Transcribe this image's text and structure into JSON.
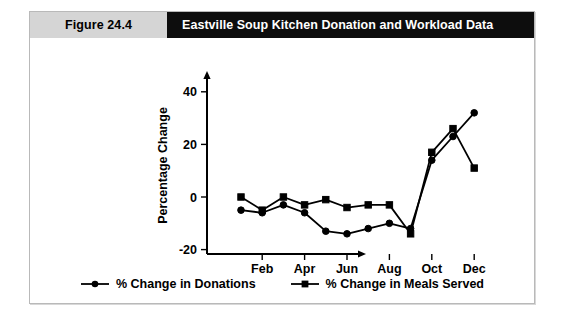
{
  "figure": {
    "number_label": "Figure 24.4",
    "title": "Eastville Soup Kitchen Donation and Workload Data"
  },
  "legend": {
    "items": [
      {
        "label": "% Change in Donations",
        "marker": "circle-marker-icon",
        "color": "#000000"
      },
      {
        "label": "% Change in Meals Served",
        "marker": "square-marker-icon",
        "color": "#000000"
      }
    ]
  },
  "chart_data": {
    "type": "line",
    "title": "Eastville Soup Kitchen Donation and Workload Data",
    "xlabel": "",
    "ylabel": "Percentage Change",
    "x": [
      "Jan",
      "Feb",
      "Mar",
      "Apr",
      "May",
      "Jun",
      "Jul",
      "Aug",
      "Sep",
      "Oct",
      "Nov",
      "Dec"
    ],
    "xtick_labels": [
      "Feb",
      "Apr",
      "Jun",
      "Aug",
      "Oct",
      "Dec"
    ],
    "xtick_indices": [
      1,
      3,
      5,
      7,
      9,
      11
    ],
    "ytick_labels": [
      "40",
      "20",
      "0",
      "-20"
    ],
    "yticks": [
      40,
      20,
      0,
      -20
    ],
    "ylim": [
      -20,
      45
    ],
    "grid": false,
    "legend_position": "bottom",
    "series": [
      {
        "name": "% Change in Donations",
        "marker": "circle",
        "color": "#000000",
        "values": [
          -5,
          -6,
          -3,
          -6,
          -13,
          -14,
          -12,
          -10,
          -12,
          14,
          23,
          32
        ]
      },
      {
        "name": "% Change in Meals Served",
        "marker": "square",
        "color": "#000000",
        "values": [
          0,
          -5,
          0,
          -3,
          -1,
          -4,
          -3,
          -3,
          -14,
          17,
          26,
          11
        ]
      }
    ]
  }
}
